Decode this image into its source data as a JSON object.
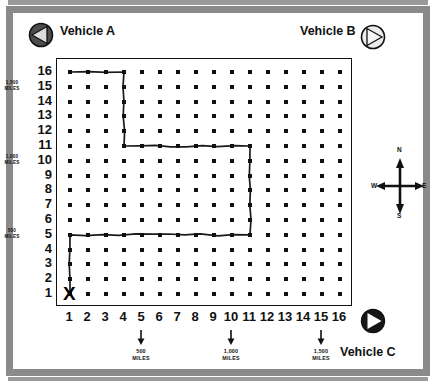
{
  "diagram": {
    "grid": {
      "cols": 16,
      "rows": 16
    },
    "start_marker": {
      "label": "X",
      "x": 1,
      "y": 1
    },
    "axis_x": {
      "ticks": [
        "1",
        "2",
        "3",
        "4",
        "5",
        "6",
        "7",
        "8",
        "9",
        "10",
        "11",
        "12",
        "13",
        "14",
        "15",
        "16"
      ],
      "markers": [
        {
          "at": 5,
          "line1": "500",
          "line2": "MILES"
        },
        {
          "at": 10,
          "line1": "1,000",
          "line2": "MILES"
        },
        {
          "at": 15,
          "line1": "1,500",
          "line2": "MILES"
        }
      ]
    },
    "axis_y": {
      "ticks": [
        "16",
        "15",
        "14",
        "13",
        "12",
        "11",
        "10",
        "9",
        "8",
        "7",
        "6",
        "5",
        "4",
        "3",
        "2",
        "1"
      ],
      "markers": [
        {
          "at": 15,
          "line1": "1,500",
          "line2": "MILES"
        },
        {
          "at": 10,
          "line1": "1,000",
          "line2": "MILES"
        },
        {
          "at": 5,
          "line1": "500",
          "line2": "MILES"
        }
      ]
    },
    "route": {
      "points": [
        [
          1,
          1
        ],
        [
          1,
          5
        ],
        [
          11,
          5
        ],
        [
          11,
          11
        ],
        [
          4,
          11
        ],
        [
          4,
          16
        ],
        [
          1,
          16
        ]
      ],
      "color": "#1a1a1a"
    },
    "vehicles": [
      {
        "id": "a",
        "label": "Vehicle A",
        "icon": "compass-triangle-left-icon",
        "fill": "#4d4d4d",
        "triangle_fill": "#d9d9d9"
      },
      {
        "id": "b",
        "label": "Vehicle B",
        "icon": "compass-triangle-right-icon",
        "fill": "#e8e8e8",
        "triangle_fill": "#f7f7f7"
      },
      {
        "id": "c",
        "label": "Vehicle  C",
        "icon": "compass-triangle-right-filled-icon",
        "fill": "#1a1a1a",
        "triangle_fill": "#ffffff"
      }
    ],
    "compass": {
      "north": "N",
      "south": "S",
      "east": "E",
      "west": "W"
    },
    "colors": {
      "frame": "#8a8a8a",
      "ink": "#111111",
      "paper": "#ffffff"
    }
  }
}
